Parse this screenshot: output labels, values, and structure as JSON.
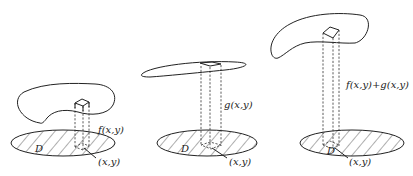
{
  "panels": [
    {
      "id": "panel-f",
      "surface_label": "f(x,y)",
      "region_label": "D",
      "point_label": "(x,y)"
    },
    {
      "id": "panel-g",
      "surface_label": "g(x,y)",
      "region_label": "D",
      "point_label": "(x,y)"
    },
    {
      "id": "panel-f-plus-g",
      "surface_label": "f(x,y)+g(x,y)",
      "region_label": "D",
      "point_label": "(x,y)"
    }
  ]
}
